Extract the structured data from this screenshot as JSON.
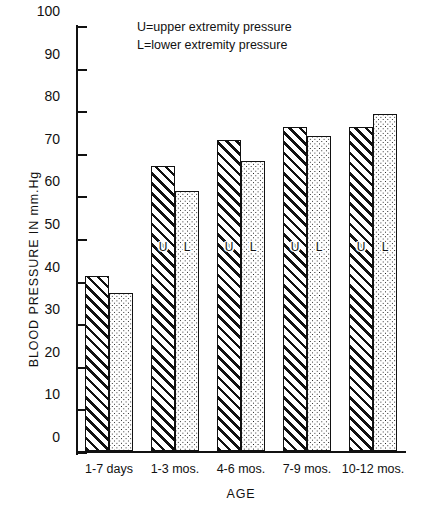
{
  "chart_data": {
    "type": "bar",
    "title": "",
    "xlabel": "AGE",
    "ylabel": "BLOOD PRESSURE IN mm.Hg",
    "ylim": [
      0,
      100
    ],
    "ytick_step": 10,
    "yticks": [
      0,
      10,
      20,
      30,
      40,
      50,
      60,
      70,
      80,
      90,
      100
    ],
    "ytick_labels": [
      "0",
      "10",
      "20",
      "30",
      "40",
      "50",
      "60",
      "70",
      "80",
      "90",
      "100"
    ],
    "grid": false,
    "legend_position": "top-center",
    "categories": [
      "1-7 days",
      "1-3 mos.",
      "4-6 mos.",
      "7-9 mos.",
      "10-12 mos."
    ],
    "series": [
      {
        "name": "U",
        "legend": "U=upper extremity pressure",
        "pattern": "diagonal-hatch",
        "bar_letter": "U",
        "values": [
          41,
          67,
          73,
          76,
          76
        ]
      },
      {
        "name": "L",
        "legend": "L=lower extremity pressure",
        "pattern": "dotted",
        "bar_letter": "L",
        "values": [
          37,
          61,
          68,
          74,
          79
        ]
      }
    ],
    "annotations": [
      "U=upper extremity pressure",
      "L=lower extremity pressure"
    ]
  },
  "colors": {
    "ink": "#111111",
    "background": "#ffffff"
  }
}
